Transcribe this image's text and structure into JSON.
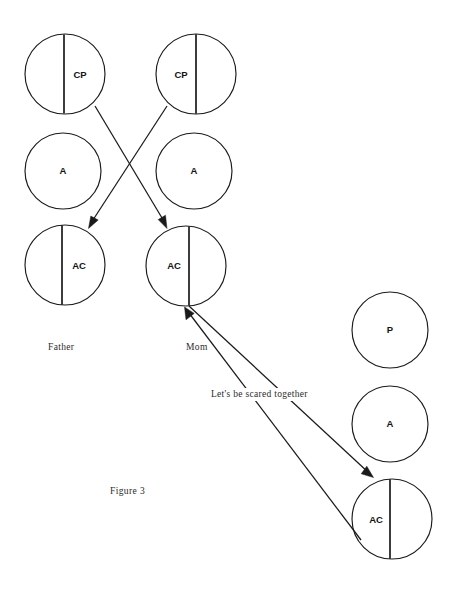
{
  "figure": {
    "caption": "Figure 3",
    "background_color": "#ffffff",
    "ink_color": "#1a1a1a",
    "width": 451,
    "height": 589
  },
  "columns": [
    {
      "id": "father",
      "label": "Father",
      "label_x": 48,
      "label_y": 350
    },
    {
      "id": "mom",
      "label": "Mom",
      "label_x": 186,
      "label_y": 350
    },
    {
      "id": "child",
      "label": "",
      "label_x": 0,
      "label_y": 0
    }
  ],
  "ego_states": [
    {
      "id": "father-cp",
      "column": "father",
      "label": "CP",
      "cx": 65,
      "cy": 74,
      "r": 40,
      "divided": true,
      "divider_x": 64,
      "label_x": 80,
      "label_y": 75
    },
    {
      "id": "father-a",
      "column": "father",
      "label": "A",
      "cx": 63,
      "cy": 171,
      "r": 38,
      "divided": false,
      "divider_x": 0,
      "label_x": 63,
      "label_y": 171
    },
    {
      "id": "father-ac",
      "column": "father",
      "label": "AC",
      "cx": 65,
      "cy": 265,
      "r": 40,
      "divided": true,
      "divider_x": 62,
      "label_x": 79,
      "label_y": 266
    },
    {
      "id": "mom-cp",
      "column": "mom",
      "label": "CP",
      "cx": 196,
      "cy": 74,
      "r": 40,
      "divided": true,
      "divider_x": 196,
      "label_x": 181,
      "label_y": 75
    },
    {
      "id": "mom-a",
      "column": "mom",
      "label": "A",
      "cx": 194,
      "cy": 171,
      "r": 38,
      "divided": false,
      "divider_x": 0,
      "label_x": 194,
      "label_y": 171
    },
    {
      "id": "mom-ac",
      "column": "mom",
      "label": "AC",
      "cx": 186,
      "cy": 266,
      "r": 40,
      "divided": true,
      "divider_x": 189,
      "label_x": 174,
      "label_y": 266
    },
    {
      "id": "child-p",
      "column": "child",
      "label": "P",
      "cx": 390,
      "cy": 330,
      "r": 38,
      "divided": false,
      "divider_x": 0,
      "label_x": 390,
      "label_y": 330
    },
    {
      "id": "child-a",
      "column": "child",
      "label": "A",
      "cx": 390,
      "cy": 424,
      "r": 38,
      "divided": false,
      "divider_x": 0,
      "label_x": 390,
      "label_y": 424
    },
    {
      "id": "child-ac",
      "column": "child",
      "label": "AC",
      "cx": 392,
      "cy": 519,
      "r": 40,
      "divided": true,
      "divider_x": 390,
      "label_x": 376,
      "label_y": 520
    }
  ],
  "transactions": [
    {
      "id": "father-cp-to-mom-ac",
      "from": "father-cp",
      "to": "mom-ac",
      "x1": 95,
      "y1": 106,
      "x2": 167,
      "y2": 227,
      "arrow": "end",
      "label": ""
    },
    {
      "id": "mom-cp-to-father-ac",
      "from": "mom-cp",
      "to": "father-ac",
      "x1": 167,
      "y1": 106,
      "x2": 89,
      "y2": 227,
      "arrow": "end",
      "label": ""
    },
    {
      "id": "mom-ac-to-child-ac",
      "from": "mom-ac",
      "to": "child-ac",
      "x1": 189,
      "y1": 306,
      "x2": 373,
      "y2": 477,
      "arrow": "end",
      "label": "Let's be scared together"
    },
    {
      "id": "child-ac-to-mom-ac",
      "from": "child-ac",
      "to": "mom-ac",
      "x1": 361,
      "y1": 540,
      "x2": 185,
      "y2": 308,
      "arrow": "end",
      "label": ""
    }
  ],
  "transaction_label": {
    "text": "Let's be scared together",
    "x": 211,
    "y": 397
  }
}
